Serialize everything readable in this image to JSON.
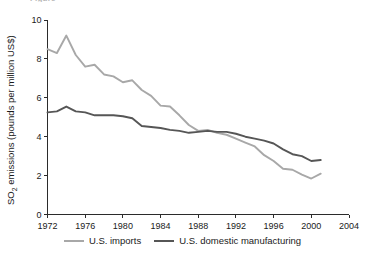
{
  "figure": {
    "clipped_header_text": "Figure"
  },
  "axes": {
    "ylabel_prefix": "SO",
    "ylabel_sub": "2",
    "ylabel_suffix": " emissions (pounds per million US$)",
    "ylabel_full": "SO2 emissions (pounds per million US$)",
    "xlabel": "",
    "yticks": [
      0,
      2,
      4,
      6,
      8,
      10
    ],
    "xticks": [
      1972,
      1976,
      1980,
      1984,
      1988,
      1992,
      1996,
      2000,
      2004
    ]
  },
  "legend": {
    "position": "bottom-center",
    "entries": [
      {
        "label": "U.S. imports",
        "color": "#a8a8a8"
      },
      {
        "label": "U.S. domestic manufacturing",
        "color": "#565656"
      }
    ]
  },
  "colors": {
    "imports": "#a8a8a8",
    "domestic": "#565656",
    "axis": "#2b2b2b",
    "text": "#1a1a1a",
    "background": "#ffffff"
  },
  "chart_data": {
    "type": "line",
    "title": "",
    "xlabel": "",
    "ylabel": "SO2 emissions (pounds per million US$)",
    "xlim": [
      1972,
      2004
    ],
    "ylim": [
      0,
      10
    ],
    "grid": false,
    "legend_position": "bottom-center",
    "x": [
      1972,
      1973,
      1974,
      1975,
      1976,
      1977,
      1978,
      1979,
      1980,
      1981,
      1982,
      1983,
      1984,
      1985,
      1986,
      1987,
      1988,
      1989,
      1990,
      1991,
      1992,
      1993,
      1994,
      1995,
      1996,
      1997,
      1998,
      1999,
      2000,
      2001
    ],
    "series": [
      {
        "name": "U.S. imports",
        "color": "#a8a8a8",
        "values": [
          8.5,
          8.3,
          9.2,
          8.2,
          7.6,
          7.7,
          7.2,
          7.1,
          6.8,
          6.9,
          6.4,
          6.1,
          5.6,
          5.55,
          5.1,
          4.6,
          4.3,
          4.35,
          4.2,
          4.1,
          3.9,
          3.7,
          3.5,
          3.05,
          2.75,
          2.35,
          2.3,
          2.05,
          1.85,
          2.1
        ]
      },
      {
        "name": "U.S. domestic manufacturing",
        "color": "#565656",
        "values": [
          5.25,
          5.3,
          5.55,
          5.3,
          5.25,
          5.1,
          5.1,
          5.1,
          5.05,
          4.95,
          4.55,
          4.5,
          4.45,
          4.35,
          4.3,
          4.2,
          4.25,
          4.3,
          4.25,
          4.25,
          4.15,
          4.0,
          3.9,
          3.8,
          3.65,
          3.35,
          3.1,
          3.0,
          2.75,
          2.8
        ]
      }
    ]
  }
}
